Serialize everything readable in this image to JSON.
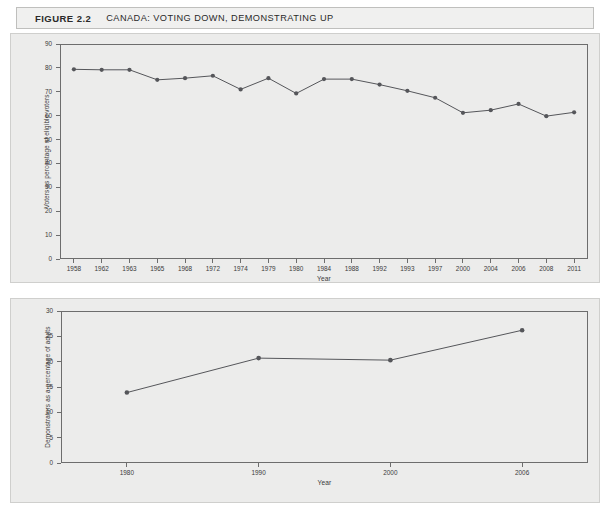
{
  "figure": {
    "number_label": "FIGURE 2.2",
    "title": "CANADA: VOTING DOWN, DEMONSTRATING UP"
  },
  "colors": {
    "panel_background": "#ececeb",
    "page_background": "#ffffff",
    "axis": "#6d6d6d",
    "line": "#55565a",
    "marker": "#55565a",
    "text": "#3a3a3a",
    "title_text": "#2a2a2a",
    "title_bar_background": "#f0f0ef",
    "border": "#cfcfcd"
  },
  "chart_data": [
    {
      "id": "voting-chart",
      "type": "line",
      "title": "",
      "xlabel": "Year",
      "ylabel": "Voters as percentage of eligible voters",
      "ylim": [
        0,
        90
      ],
      "yticks": [
        0,
        10,
        20,
        30,
        40,
        50,
        60,
        70,
        80,
        90
      ],
      "grid": false,
      "legend": "none",
      "categories": [
        "1958",
        "1962",
        "1963",
        "1965",
        "1968",
        "1972",
        "1974",
        "1979",
        "1980",
        "1984",
        "1988",
        "1992",
        "1993",
        "1997",
        "2000",
        "2004",
        "2006",
        "2008",
        "2011"
      ],
      "values": [
        79.4,
        79.2,
        79.2,
        75.0,
        75.7,
        76.7,
        71.0,
        75.7,
        69.3,
        75.3,
        75.3,
        73.0,
        70.4,
        67.5,
        61.2,
        62.3,
        64.9,
        59.8,
        61.4
      ]
    },
    {
      "id": "demonstrating-chart",
      "type": "line",
      "title": "",
      "xlabel": "Year",
      "ylabel": "Demonstrators as a percentage of adults",
      "ylim": [
        0,
        30
      ],
      "yticks": [
        0,
        5,
        10,
        15,
        20,
        25,
        30
      ],
      "grid": false,
      "legend": "none",
      "categories": [
        "1980",
        "1990",
        "2000",
        "2006"
      ],
      "values": [
        13.9,
        20.7,
        20.3,
        26.2
      ]
    }
  ]
}
